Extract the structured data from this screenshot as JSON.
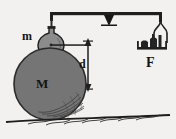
{
  "figure": {
    "background_color": "#f2f1ef",
    "ink_color": "#1c1c1c",
    "sphere_fill": "#7a7a7a",
    "labels": {
      "small_mass": "m",
      "large_mass": "M",
      "distance": "d",
      "force_side": "F"
    },
    "elements": {
      "beam": "horizontal-balance-beam",
      "fulcrum": "triangular-pivot",
      "hanging_ball": "small-sphere-mass-m",
      "pan": "weighing-pan-with-weights",
      "big_sphere": "large-sphere-mass-M",
      "dimension_arrow": "vertical-double-headed-arrow",
      "ground": "hatched-ground-line"
    }
  }
}
